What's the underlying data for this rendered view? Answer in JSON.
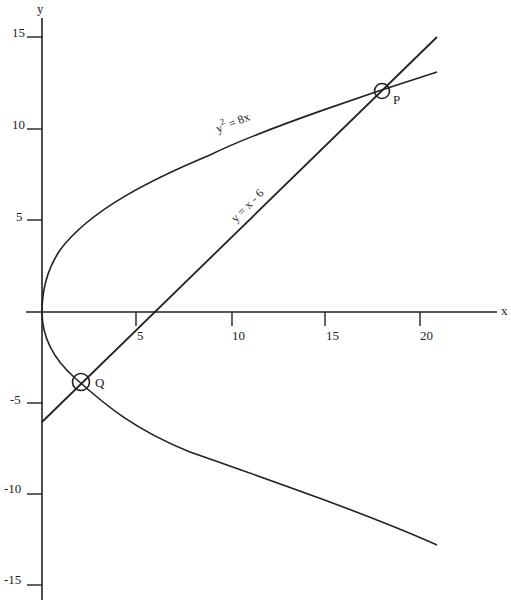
{
  "diagram": {
    "axes": {
      "x_label": "x",
      "y_label": "y",
      "x_ticks": [
        {
          "value": 5,
          "label": "5"
        },
        {
          "value": 10,
          "label": "10"
        },
        {
          "value": 15,
          "label": "15"
        },
        {
          "value": 20,
          "label": "20"
        }
      ],
      "y_ticks": [
        {
          "value": 15,
          "label": "15"
        },
        {
          "value": 10,
          "label": "10"
        },
        {
          "value": 5,
          "label": "5"
        },
        {
          "value": -5,
          "label": "-5"
        },
        {
          "value": -10,
          "label": "-10"
        },
        {
          "value": -15,
          "label": "-15"
        }
      ]
    },
    "curves": {
      "parabola": {
        "label_base": "y",
        "label_sup": "2",
        "label_rest": " = 8x",
        "equation": "y^2 = 8x"
      },
      "line": {
        "label": "y = x - 6",
        "equation": "y = x - 6"
      }
    },
    "points": [
      {
        "name": "P",
        "label": "P",
        "x": 18,
        "y": 12
      },
      {
        "name": "Q",
        "label": "Q",
        "x": 2,
        "y": -4
      }
    ],
    "colors": {
      "stroke": "#222222",
      "background": "#ffffff"
    }
  }
}
